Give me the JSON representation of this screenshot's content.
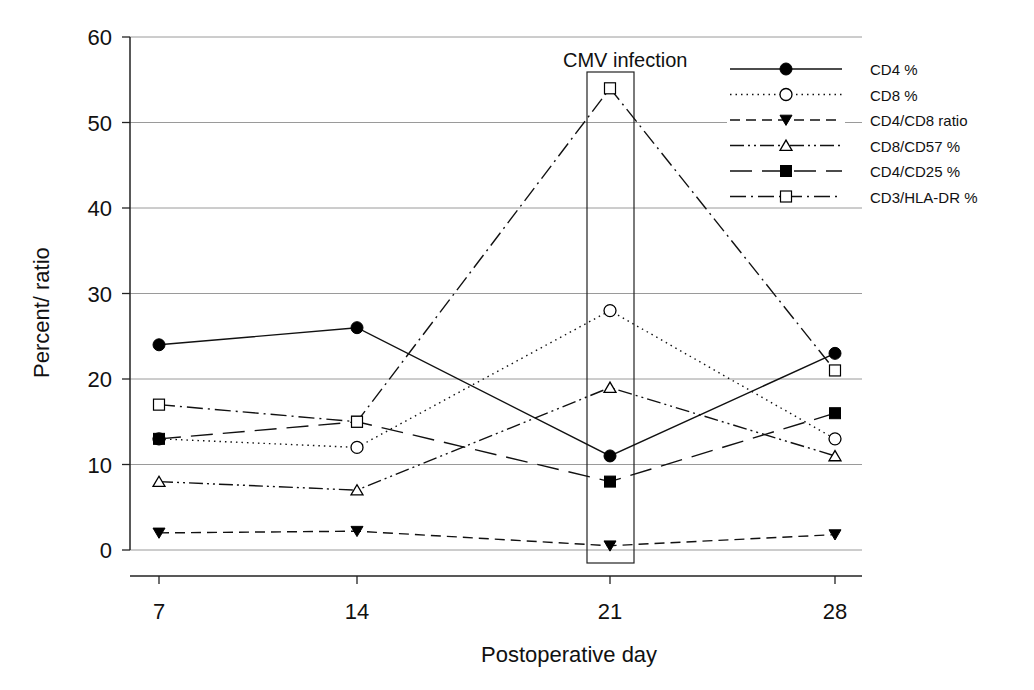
{
  "chart_data": {
    "type": "line",
    "title": "",
    "xlabel": "Postoperative day",
    "ylabel": "Percent/ ratio",
    "x": [
      7,
      14,
      21,
      28
    ],
    "x_tick_labels": [
      "7",
      "14",
      "21",
      "28"
    ],
    "y_tick_labels": [
      "0",
      "10",
      "20",
      "30",
      "40",
      "50",
      "60"
    ],
    "ylim": [
      0,
      60
    ],
    "grid": "horizontal",
    "legend_position": "upper right",
    "annotations": [
      {
        "text": "CMV infection",
        "x": 21,
        "shape": "rectangle"
      }
    ],
    "series": [
      {
        "name": "CD4 %",
        "marker": "filled-circle",
        "line": "solid",
        "values": [
          24,
          26,
          11,
          23
        ]
      },
      {
        "name": "CD8 %",
        "marker": "open-circle",
        "line": "dotted",
        "values": [
          13,
          12,
          28,
          13
        ]
      },
      {
        "name": "CD4/CD8 ratio",
        "marker": "filled-triangle-down",
        "line": "dashed",
        "values": [
          2,
          2.2,
          0.5,
          1.8
        ]
      },
      {
        "name": "CD8/CD57 %",
        "marker": "open-triangle-up",
        "line": "dash-dot-dot",
        "values": [
          8,
          7,
          19,
          11
        ]
      },
      {
        "name": "CD4/CD25 %",
        "marker": "filled-square",
        "line": "long-dash",
        "values": [
          13,
          15,
          8,
          16
        ]
      },
      {
        "name": "CD3/HLA-DR %",
        "marker": "open-square",
        "line": "dash-dot",
        "values": [
          17,
          15,
          54,
          21
        ]
      }
    ]
  }
}
